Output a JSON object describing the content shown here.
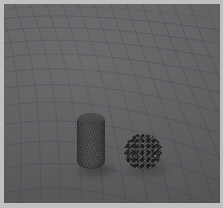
{
  "scene": {
    "title": "3D physics simulation render",
    "description": "Perspective view of a warped grid ground plane with a rigid cylinder and a granular particle pile resting on it",
    "render_type": "rasterized 3D viewport",
    "background_color": "#5e6062",
    "frame_color": "#c0c0c0",
    "grid": {
      "name": "ground-plane-grid",
      "line_color": "#4c4e50",
      "projection": "perspective",
      "curvature": "barrel-warped mesh converging toward upper-left",
      "u_lines": 22,
      "v_lines": 18
    },
    "objects": [
      {
        "name": "cylinder",
        "label": "rigid cylinder",
        "color": "#434547",
        "x": 77,
        "y": 113,
        "width": 28,
        "height": 56,
        "shape": "capsule-cylinder"
      },
      {
        "name": "granular-pile",
        "label": "granular particle pile",
        "color": "#424446",
        "x": 125,
        "y": 135,
        "width": 36,
        "height": 34,
        "shape": "irregular-blob"
      }
    ]
  }
}
